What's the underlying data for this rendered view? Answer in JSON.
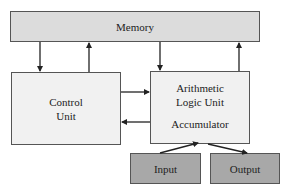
{
  "diagram": {
    "nodes": {
      "memory": {
        "label": "Memory"
      },
      "control_unit": {
        "line1": "Control",
        "line2": "Unit"
      },
      "alu": {
        "line1": "Arithmetic",
        "line2": "Logic Unit",
        "line3": "Accumulator"
      },
      "input": {
        "label": "Input"
      },
      "output": {
        "label": "Output"
      }
    },
    "edges": [
      {
        "from": "Memory",
        "to": "Control Unit"
      },
      {
        "from": "Control Unit",
        "to": "Memory"
      },
      {
        "from": "Memory",
        "to": "Arithmetic Logic Unit"
      },
      {
        "from": "Arithmetic Logic Unit",
        "to": "Memory"
      },
      {
        "from": "Control Unit",
        "to": "Arithmetic Logic Unit"
      },
      {
        "from": "Arithmetic Logic Unit",
        "to": "Control Unit"
      },
      {
        "from": "Input",
        "to": "Accumulator"
      },
      {
        "from": "Accumulator",
        "to": "Output"
      }
    ],
    "colors": {
      "memory_fill": "#dcdcdc",
      "unit_fill": "#f1f1f1",
      "io_fill": "#a8a8a8",
      "stroke": "#333333"
    }
  }
}
